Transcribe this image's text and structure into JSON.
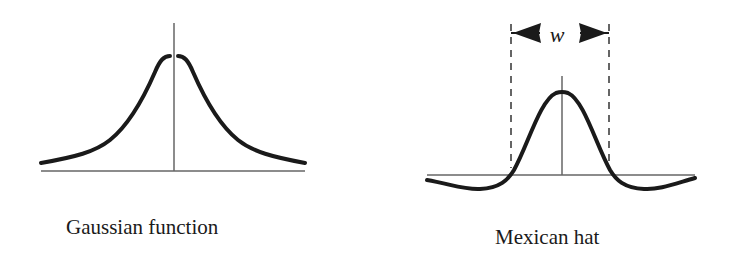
{
  "colors": {
    "curve": "#1a1a1a",
    "axis": "#555555",
    "background": "#ffffff"
  },
  "figures": [
    {
      "id": "gaussian",
      "caption": "Gaussian function",
      "shape": "bell curve, positive everywhere"
    },
    {
      "id": "mexican_hat",
      "caption": "Mexican hat",
      "shape": "central positive peak with negative side lobes",
      "width_label": "w",
      "width_annotation": "double arrow between two dashed vertical lines marking zero crossings"
    }
  ]
}
